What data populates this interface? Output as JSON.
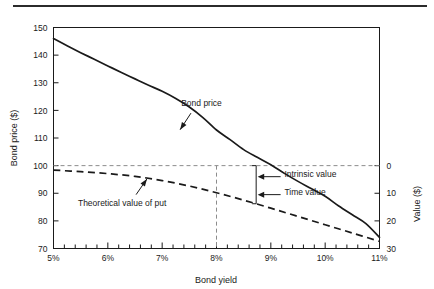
{
  "figure": {
    "background_color": "#ffffff",
    "rule_color": "#2b2b2b",
    "line_color": "#1a1a1a",
    "guide_color": "#8c8c8c"
  },
  "chart_data": {
    "type": "line",
    "title": "",
    "xlabel": "Bond yield",
    "ylabel": "Bond price ($)",
    "y2label": "Value ($)",
    "xlim": [
      5,
      11
    ],
    "ylim": [
      70,
      150
    ],
    "y2lim": [
      30,
      0
    ],
    "grid": false,
    "legend_position": "inline-annotations",
    "x_ticks": [
      "5%",
      "6%",
      "7%",
      "8%",
      "9%",
      "10%",
      "11%"
    ],
    "x_tick_values": [
      5,
      6,
      7,
      8,
      9,
      10,
      11
    ],
    "x_minor_per_major": 5,
    "y_ticks": [
      "70",
      "80",
      "90",
      "100",
      "110",
      "120",
      "130",
      "140",
      "150"
    ],
    "y_tick_values": [
      70,
      80,
      90,
      100,
      110,
      120,
      130,
      140,
      150
    ],
    "y2_ticks": [
      "0",
      "10",
      "20",
      "30"
    ],
    "y2_tick_values": [
      0,
      10,
      20,
      30
    ],
    "series": [
      {
        "name": "Bond price",
        "style": "solid",
        "x": [
          5.0,
          5.25,
          5.5,
          5.75,
          6.0,
          6.25,
          6.5,
          6.75,
          7.0,
          7.25,
          7.5,
          7.75,
          8.0,
          8.25,
          8.5,
          8.75,
          9.0,
          9.25,
          9.5,
          9.75,
          10.0,
          10.25,
          10.5,
          10.75,
          11.0
        ],
        "values": [
          146.0,
          143.4,
          140.9,
          138.5,
          136.1,
          133.7,
          131.4,
          129.1,
          126.9,
          124.3,
          121.2,
          117.4,
          112.9,
          109.4,
          105.8,
          103.0,
          100.3,
          97.2,
          94.3,
          91.6,
          88.9,
          85.4,
          82.2,
          79.0,
          74.0
        ]
      },
      {
        "name": "Theoretical value of put",
        "style": "dashed",
        "x": [
          5.0,
          5.5,
          6.0,
          6.5,
          7.0,
          7.5,
          8.0,
          8.5,
          9.0,
          9.5,
          10.0,
          10.5,
          11.0
        ],
        "values": [
          98.4,
          97.8,
          97.1,
          96.1,
          94.6,
          92.6,
          90.2,
          87.5,
          84.6,
          81.6,
          78.6,
          75.6,
          72.6
        ]
      }
    ],
    "reference_lines": [
      {
        "name": "par-value-line",
        "orientation": "horizontal",
        "value": 100,
        "style": "dashed"
      },
      {
        "name": "par-yield-line",
        "orientation": "vertical",
        "value": 8,
        "style": "dashed",
        "y_from": 70,
        "y_to": 100
      }
    ],
    "annotations": [
      {
        "name": "bond-price-label",
        "text": "Bond price",
        "x": 7.35,
        "y": 121.5
      },
      {
        "name": "theoretical-put-label",
        "text": "Theoretical value of put",
        "x": 5.45,
        "y": 85.5
      },
      {
        "name": "intrinsic-value-label",
        "text": "Intrinsic value",
        "x": 9.25,
        "y": 96.0
      },
      {
        "name": "time-value-label",
        "text": "Time value",
        "x": 9.25,
        "y": 89.5
      }
    ],
    "bracket": {
      "name": "value-decomposition-bracket",
      "x": 8.73,
      "y_top": 100,
      "y_bottom": 86.2,
      "intrinsic_arrow_y": 96.0,
      "time_arrow_y": 89.5
    }
  }
}
